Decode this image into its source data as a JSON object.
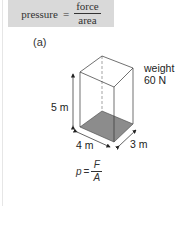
{
  "formula": {
    "lhs": "pressure",
    "equals": "=",
    "numerator": "force",
    "denominator": "area"
  },
  "figure": {
    "label": "(a)",
    "weight_label": "weight",
    "weight_value": "60 N",
    "height_label": "5 m",
    "width_label": "4 m",
    "depth_label": "3 m",
    "box_shading_color": "#8c8c8c"
  },
  "equation": {
    "lhs": "p",
    "equals": "=",
    "numerator": "F",
    "denominator": "A"
  }
}
